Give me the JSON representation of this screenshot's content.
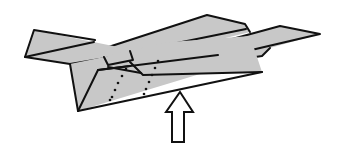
{
  "diagram": {
    "elements": [
      {
        "id": "left-wing",
        "kind": "wing panel"
      },
      {
        "id": "fuselage-body",
        "kind": "folded body"
      },
      {
        "id": "top-fin",
        "kind": "upper wing panel"
      },
      {
        "id": "right-wing-tip",
        "kind": "wing tip"
      },
      {
        "id": "dotted-fold-lines",
        "kind": "fold guides",
        "count": 2
      },
      {
        "id": "push-up-arrow",
        "kind": "instruction arrow",
        "direction": "up"
      }
    ]
  },
  "colors": {
    "paper": "#c8c8c8",
    "ink": "#111111",
    "background": "#ffffff"
  }
}
